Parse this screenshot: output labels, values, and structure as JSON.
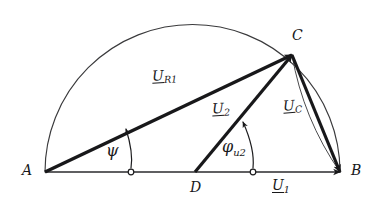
{
  "figure": {
    "type": "phasor-diagram",
    "background_color": "#ffffff",
    "ink_color": "#18181a",
    "thin_line_color": "#4a4a4a"
  },
  "vertices": [
    {
      "id": "A",
      "label": "A",
      "x": 45,
      "y": 172,
      "label_x": 22,
      "label_y": 163
    },
    {
      "id": "B",
      "label": "B",
      "x": 340,
      "y": 172,
      "label_x": 351,
      "label_y": 163
    },
    {
      "id": "C",
      "label": "C",
      "x": 292,
      "y": 55,
      "label_x": 292,
      "label_y": 28
    },
    {
      "id": "D",
      "label": "D",
      "x": 195,
      "y": 172,
      "label_x": 190,
      "label_y": 180
    }
  ],
  "phasors": [
    {
      "name": "U_R1",
      "base": "U",
      "subscript": "R1",
      "from": "A",
      "to": "C",
      "x1": 45,
      "y1": 172,
      "x2": 292,
      "y2": 55,
      "label_x": 152,
      "label_y": 68,
      "arrow": true,
      "weight": "thick"
    },
    {
      "name": "U_2",
      "base": "U",
      "subscript": "2",
      "from": "D",
      "to": "C",
      "x1": 195,
      "y1": 172,
      "x2": 292,
      "y2": 55,
      "label_x": 212,
      "label_y": 101,
      "arrow": true,
      "weight": "thick"
    },
    {
      "name": "U_C",
      "base": "U",
      "subscript": "C",
      "from": "C",
      "to": "B",
      "x1": 292,
      "y1": 55,
      "x2": 340,
      "y2": 172,
      "label_x": 283,
      "label_y": 98,
      "arrow": true,
      "weight": "thick"
    },
    {
      "name": "U_1",
      "base": "U",
      "subscript": "1",
      "from": "A",
      "to": "B",
      "x1": 45,
      "y1": 172,
      "x2": 340,
      "y2": 172,
      "label_x": 272,
      "label_y": 178,
      "arrow": true,
      "weight": "thin"
    }
  ],
  "angles": [
    {
      "name": "psi",
      "symbol": "ψ",
      "subscript": "",
      "label_x": 106,
      "label_y": 143,
      "vertex": "A",
      "arc_from_x": 131,
      "arc_from_y": 172,
      "arc_to_x": 126,
      "arc_to_y": 129,
      "pivot_x": 131,
      "pivot_y": 172
    },
    {
      "name": "phi_u2",
      "symbol": "φ",
      "subscript": "u2",
      "label_x": 222,
      "label_y": 139,
      "vertex": "D",
      "arc_from_x": 253,
      "arc_from_y": 172,
      "arc_to_x": 243,
      "arc_to_y": 122,
      "pivot_x": 253,
      "pivot_y": 172
    }
  ],
  "semicircle": {
    "name": "thales-semicircle",
    "center_x": 192.5,
    "center_y": 172,
    "radius": 147.5,
    "from_x": 45,
    "from_y": 172,
    "to_x": 340,
    "to_y": 172,
    "style": "thin"
  },
  "arc_chord": {
    "name": "chord-arc-C-to-B",
    "from_x": 292,
    "from_y": 55,
    "to_x": 340,
    "to_y": 172,
    "bulge": 14
  }
}
